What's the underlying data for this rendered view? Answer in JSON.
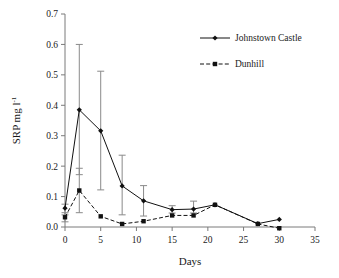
{
  "chart_data": {
    "type": "line",
    "title": "",
    "xlabel": "Days",
    "ylabel": "SRP mg l-1",
    "ylabel_main": "SRP mg l",
    "ylabel_exponent": "-1",
    "xlim": [
      0,
      35
    ],
    "ylim": [
      0.0,
      0.7
    ],
    "xticks": [
      0,
      5,
      10,
      15,
      20,
      25,
      30,
      35
    ],
    "xtick_labels": [
      "0",
      "5",
      "10",
      "15",
      "20",
      "25",
      "30",
      "35"
    ],
    "yticks": [
      0.0,
      0.1,
      0.2,
      0.3,
      0.4,
      0.5,
      0.6,
      0.7
    ],
    "ytick_labels": [
      "0.0",
      "0.1",
      "0.2",
      "0.3",
      "0.4",
      "0.5",
      "0.6",
      "0.7"
    ],
    "grid": false,
    "legend_position": "top-right",
    "x": [
      0,
      2,
      5,
      8,
      11,
      15,
      18,
      21,
      27,
      30
    ],
    "series": [
      {
        "name": "Johnstown Castle",
        "marker": "diamond",
        "linestyle": "solid",
        "color": "#111111",
        "values": [
          0.062,
          0.385,
          0.316,
          0.135,
          0.086,
          0.057,
          0.059,
          0.073,
          0.011,
          0.025
        ],
        "err_low": [
          0.04,
          0.172,
          0.122,
          0.04,
          0.036,
          0.046,
          0.046,
          0.073,
          0.011,
          0.025
        ],
        "err_high": [
          0.075,
          0.6,
          0.512,
          0.236,
          0.136,
          0.07,
          0.085,
          0.073,
          0.011,
          0.025
        ]
      },
      {
        "name": "Dunhill",
        "marker": "square",
        "linestyle": "dashed",
        "color": "#111111",
        "values": [
          0.032,
          0.12,
          0.035,
          0.01,
          0.019,
          0.038,
          0.038,
          0.073,
          0.01,
          -0.004
        ],
        "err_low": [
          0.017,
          0.047,
          0.035,
          0.01,
          0.019,
          0.038,
          0.038,
          0.073,
          0.01,
          -0.004
        ],
        "err_high": [
          0.047,
          0.193,
          0.035,
          0.01,
          0.019,
          0.038,
          0.038,
          0.073,
          0.01,
          -0.004
        ]
      }
    ],
    "legend": [
      {
        "label": "Johnstown Castle",
        "linestyle": "solid",
        "marker": "diamond"
      },
      {
        "label": "Dunhill",
        "linestyle": "dashed",
        "marker": "square"
      }
    ]
  }
}
